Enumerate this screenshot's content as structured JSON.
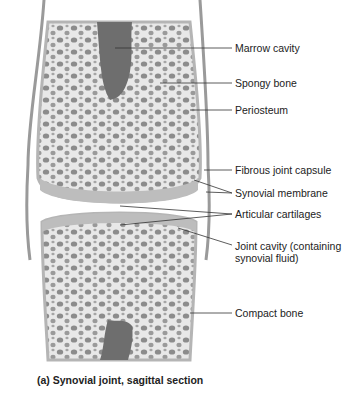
{
  "labels": {
    "marrow_cavity": "Marrow cavity",
    "spongy_bone": "Spongy bone",
    "periosteum": "Periosteum",
    "fibrous_joint_capsule": "Fibrous joint capsule",
    "synovial_membrane": "Synovial membrane",
    "articular_cartilages": "Articular cartilages",
    "joint_cavity_line1": "Joint cavity (containing",
    "joint_cavity_line2": "synovial fluid)",
    "compact_bone": "Compact bone"
  },
  "caption": "(a) Synovial joint, sagittal section",
  "colors": {
    "bone": "#e6e6e6",
    "marrow": "#6e6e6e",
    "pore": "#8a8a8a",
    "cartilage": "#bdbdbd",
    "capsule": "#9a9a9a",
    "leader": "#333333"
  }
}
